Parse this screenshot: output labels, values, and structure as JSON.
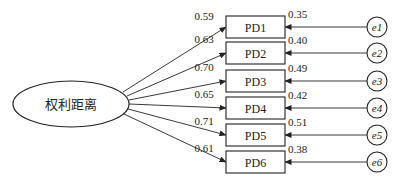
{
  "diagram": {
    "type": "structural-equation-model",
    "latent": {
      "label": "权利距离",
      "cx": 71,
      "cy": 104,
      "rx": 58,
      "ry": 23
    },
    "indicators": [
      {
        "label": "PD1",
        "loading": "0.59",
        "error_label": "e1",
        "error_var": "0.35",
        "y": 16
      },
      {
        "label": "PD2",
        "loading": "0.63",
        "error_label": "e2",
        "error_var": "0.40",
        "y": 42
      },
      {
        "label": "PD3",
        "loading": "0.70",
        "error_label": "e3",
        "error_var": "0.49",
        "y": 70
      },
      {
        "label": "PD4",
        "loading": "0.65",
        "error_label": "e4",
        "error_var": "0.42",
        "y": 97
      },
      {
        "label": "PD5",
        "loading": "0.71",
        "error_label": "e5",
        "error_var": "0.51",
        "y": 124
      },
      {
        "label": "PD6",
        "loading": "0.61",
        "error_label": "e6",
        "error_var": "0.38",
        "y": 151
      }
    ],
    "box": {
      "x": 226,
      "width": 59,
      "height": 22
    },
    "error_circle": {
      "cx": 377,
      "r": 10
    },
    "colors": {
      "stroke": "#222222",
      "background": "#ffffff",
      "text": "#222222"
    }
  }
}
